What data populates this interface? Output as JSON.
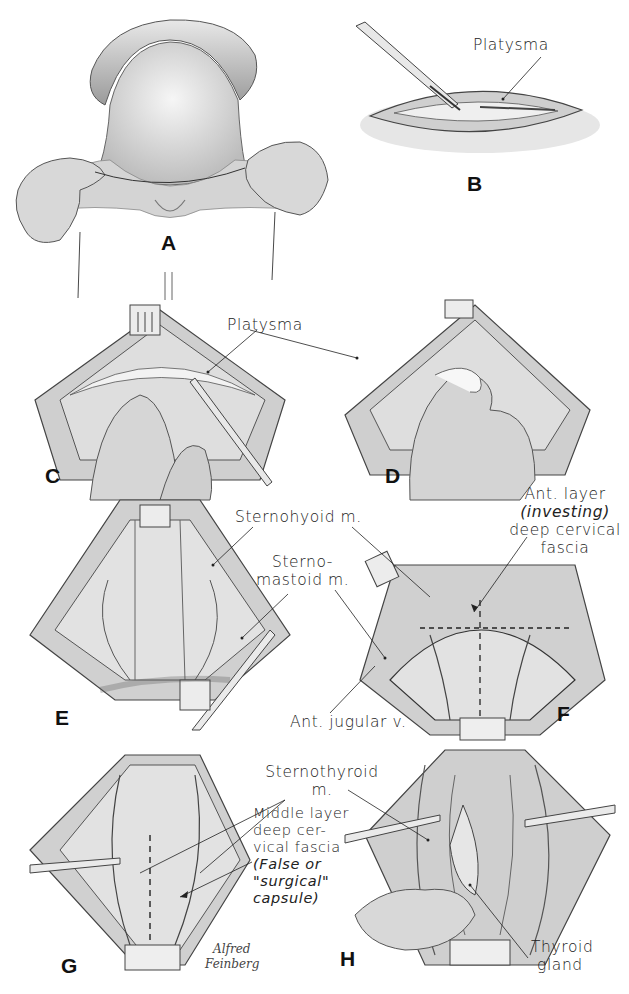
{
  "figure": {
    "panels": [
      {
        "id": "A",
        "letter": "A",
        "description": "Neck exposed, collar incision marked with ligature"
      },
      {
        "id": "B",
        "letter": "B",
        "description": "Skin incision through platysma"
      },
      {
        "id": "C",
        "letter": "C",
        "description": "Upper flap elevated with retractor"
      },
      {
        "id": "D",
        "letter": "D",
        "description": "Blunt dissection of flap with gauze"
      },
      {
        "id": "E",
        "letter": "E",
        "description": "Flaps retracted, strap muscles exposed"
      },
      {
        "id": "F",
        "letter": "F",
        "description": "Midline incision of investing fascia"
      },
      {
        "id": "G",
        "letter": "G",
        "description": "Middle layer deep cervical fascia incised"
      },
      {
        "id": "H",
        "letter": "H",
        "description": "Thyroid gland delivered"
      }
    ],
    "labels": {
      "b_platysma": "Platysma",
      "c_platysma": "Platysma",
      "sternohyoid": "Sternohyoid m.",
      "sternomastoid_1": "Sterno-",
      "sternomastoid_2": "mastoid m.",
      "ant_layer_1": "Ant. layer",
      "ant_layer_2": "(investing)",
      "ant_layer_3": "deep cervical",
      "ant_layer_4": "fascia",
      "ant_jugular": "Ant. jugular v.",
      "sternothyroid_1": "Sternothyroid",
      "sternothyroid_2": "m.",
      "middle_layer_1": "Middle layer",
      "middle_layer_2": "deep cer-",
      "middle_layer_3": "vical fascia",
      "middle_layer_4": "(False or",
      "middle_layer_5": "\"surgical\"",
      "middle_layer_6": "capsule)",
      "thyroid_1": "Thyroid",
      "thyroid_2": "gland"
    },
    "signature": {
      "line1": "Alfred",
      "line2": "Feinberg"
    }
  }
}
